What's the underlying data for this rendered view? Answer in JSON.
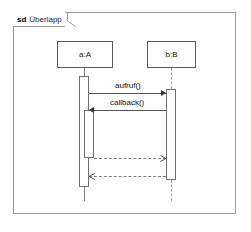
{
  "diagram": {
    "kind_label": "sd",
    "name": "Überlapp",
    "type": "uml-sequence-diagram"
  },
  "colors": {
    "background": "#ffffff",
    "frame_border": "#9a9a9a",
    "box_border": "#5a5a5a",
    "activation_border": "#6f6f6f",
    "message_line": "#555555",
    "return_line": "#7d7d7d",
    "lifeline_dashed": "#a5a5a5",
    "text": "#111111"
  },
  "lifelines": [
    {
      "id": "a",
      "label": "a:A",
      "style": "solid"
    },
    {
      "id": "b",
      "label": "b:B",
      "style": "dashed"
    }
  ],
  "messages": [
    {
      "id": "m1",
      "label": "aufruf()",
      "from": "a",
      "to": "b",
      "direction": "right",
      "style": "solid",
      "arrow": "filled"
    },
    {
      "id": "m2",
      "label": "callback()",
      "from": "b",
      "to": "a",
      "direction": "left",
      "style": "solid",
      "arrow": "filled"
    },
    {
      "id": "r1",
      "label": "",
      "from": "a",
      "to": "b",
      "direction": "right",
      "style": "dashed",
      "arrow": "open"
    },
    {
      "id": "r2",
      "label": "",
      "from": "b",
      "to": "a",
      "direction": "left",
      "style": "dashed",
      "arrow": "open"
    }
  ],
  "activations": [
    {
      "id": "act-a-outer",
      "lifeline": "a",
      "nesting": 0
    },
    {
      "id": "act-a-inner",
      "lifeline": "a",
      "nesting": 1
    },
    {
      "id": "act-b",
      "lifeline": "b",
      "nesting": 0
    }
  ]
}
